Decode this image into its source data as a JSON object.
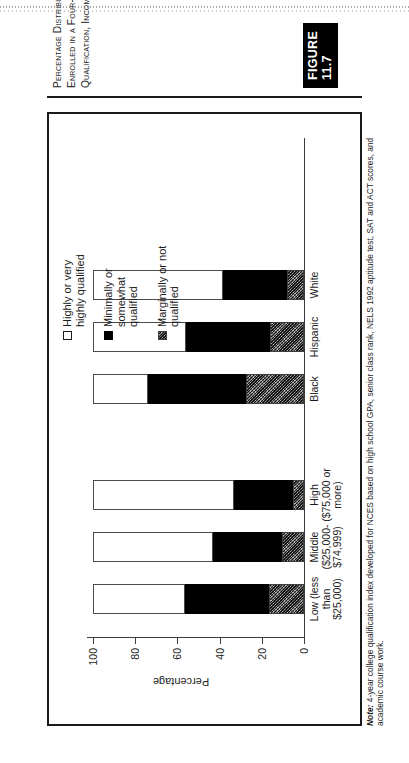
{
  "figure": {
    "number_label": "FIGURE 11.7",
    "caption": "Percentage Distribution of All 1992 High School Graduates Who Enrolled in a Four-Year Institution by 1994, by Level of College Qualification, Income, and Race/Ethnicity",
    "note_label": "Note:",
    "note_text": " 4-year college qualification index developed for NCES based on high school GPA, senior class rank, NELS 1992 aptitude test, SAT and ACT scores, and academic course work."
  },
  "legend": {
    "items": [
      {
        "label": "Highly or very\nhighly qualified",
        "swatch": "white-square-outline",
        "color": "#ffffff"
      },
      {
        "label": "Minimally or\nsomewhat\nqualified",
        "swatch": "black-square",
        "color": "#000000"
      },
      {
        "label": "Marginally or not\nqualified",
        "swatch": "stippled-gray-square",
        "color": "#6f6f6f"
      }
    ]
  },
  "chart_data": {
    "type": "bar",
    "title": "",
    "xlabel": "",
    "ylabel": "Percentage",
    "ylim": [
      0,
      100
    ],
    "yticks": [
      0,
      20,
      40,
      60,
      80,
      100
    ],
    "grid": false,
    "legend_position": "right",
    "stacked": true,
    "orientation": "vertical",
    "categories": [
      "Low (less\nthan\n$25,000)",
      "Middle\n($25,000-\n$74,999)",
      "High\n($75,000 or\nmore)",
      "Black",
      "Hispanic",
      "White"
    ],
    "series": [
      {
        "name": "Marginally or not qualified",
        "values": [
          16.5,
          10.5,
          5.0,
          27.5,
          16.0,
          8.0
        ]
      },
      {
        "name": "Minimally or somewhat qualified",
        "values": [
          40.0,
          32.5,
          28.0,
          46.5,
          40.0,
          30.5
        ]
      },
      {
        "name": "Highly or very highly qualified",
        "values": [
          43.5,
          57.0,
          67.0,
          26.0,
          44.0,
          61.5
        ]
      }
    ]
  }
}
